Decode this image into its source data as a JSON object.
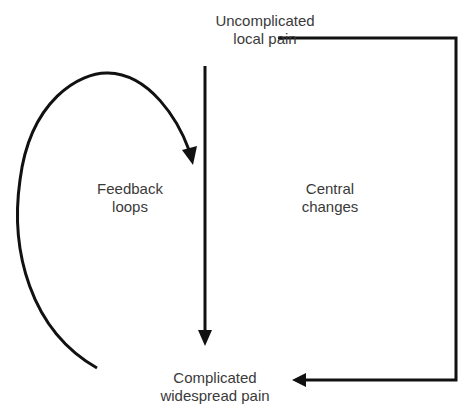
{
  "nodes": {
    "top": {
      "line1": "Uncomplicated",
      "line2": "local pain"
    },
    "bottom": {
      "line1": "Complicated",
      "line2": "widespread pain"
    }
  },
  "labels": {
    "feedback": {
      "line1": "Feedback",
      "line2": "loops"
    },
    "central": {
      "line1": "Central",
      "line2": "changes"
    }
  },
  "colors": {
    "stroke": "#111111",
    "text": "#3a3a3a"
  }
}
